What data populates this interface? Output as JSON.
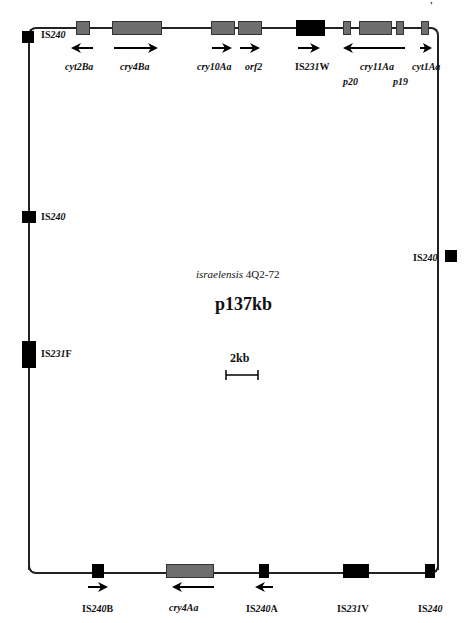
{
  "figure": {
    "strain_label_italic": "israelensis",
    "strain_label_rest": " 4Q2-72",
    "plasmid_name": "p137kb",
    "scale_label": "2kb",
    "corner_mark": "'"
  },
  "top_genes": [
    {
      "label": "cyt2Ba",
      "direction": "left"
    },
    {
      "label": "cry4Ba",
      "direction": "right"
    },
    {
      "label": "cry10Aa",
      "direction": "right"
    },
    {
      "label": "orf2",
      "direction": "right"
    },
    {
      "label_prefix": "IS",
      "label_num": "231",
      "label_suffix": "W",
      "direction": "right"
    },
    {
      "label": "cry11Aa",
      "direction": "left"
    },
    {
      "label": "p20"
    },
    {
      "label": "p19"
    },
    {
      "label": "cyt1Aa",
      "direction": "right"
    }
  ],
  "left_elements": [
    {
      "prefix": "IS",
      "num": "240",
      "suffix": ""
    },
    {
      "prefix": "IS",
      "num": "240",
      "suffix": ""
    },
    {
      "prefix": "IS",
      "num": "231",
      "suffix": "F"
    }
  ],
  "right_elements": [
    {
      "prefix": "IS",
      "num": "240",
      "suffix": ""
    }
  ],
  "bottom_elements": [
    {
      "prefix": "IS",
      "num": "240",
      "suffix": "B",
      "direction": "right"
    },
    {
      "label": "cry4Aa",
      "direction": "left"
    },
    {
      "prefix": "IS",
      "num": "240",
      "suffix": "A",
      "direction": "left"
    },
    {
      "prefix": "IS",
      "num": "231",
      "suffix": "V"
    },
    {
      "prefix": "IS",
      "num": "240",
      "suffix": ""
    }
  ]
}
